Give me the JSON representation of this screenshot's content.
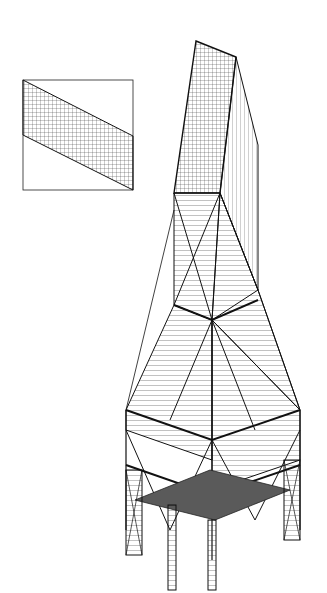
{
  "figure": {
    "type": "axonometric line drawing",
    "background_color": "#ffffff",
    "line_color": "#1a1a1a",
    "shade_color": "#5a5a5a"
  },
  "inset": {
    "description": "plan/elevation box with diagonal hatched band",
    "box": {
      "x": 23,
      "y": 80,
      "w": 110,
      "h": 110
    },
    "band": {
      "top_left": [
        23,
        80
      ],
      "top_right": [
        133,
        136
      ],
      "bottom_right": [
        133,
        190
      ],
      "bottom_left": [
        23,
        135
      ]
    }
  },
  "tower": {
    "top_face": {
      "apex": [
        196,
        41
      ],
      "corner": [
        236,
        57
      ],
      "right_edge_bottom": [
        258,
        145
      ]
    },
    "sections": [
      {
        "name": "upper shaft",
        "y_range": [
          41,
          290
        ],
        "cladding": "grid"
      },
      {
        "name": "braced middle",
        "y_range": [
          190,
          420
        ],
        "bracing": "X-braced"
      },
      {
        "name": "lower bay",
        "y_range": [
          420,
          545
        ],
        "bracing": "X-braced"
      },
      {
        "name": "base legs",
        "y_range": [
          500,
          593
        ],
        "structure": "trussed columns"
      }
    ],
    "base_platform": {
      "shaded": true
    }
  }
}
